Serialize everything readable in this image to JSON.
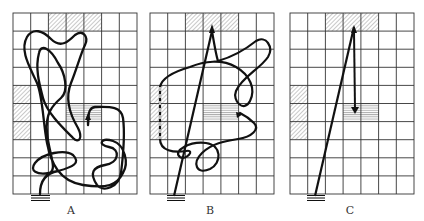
{
  "figure": {
    "panels": [
      {
        "id": "A",
        "label": "A",
        "description": "Random meandering path through grid"
      },
      {
        "id": "B",
        "label": "B",
        "description": "Straight path to top target, then meandering return to middle target"
      },
      {
        "id": "C",
        "label": "C",
        "description": "Straight path to top target, then straight down to middle target"
      }
    ],
    "grid": {
      "columns": 7,
      "rows": 10
    },
    "shaded_regions": {
      "top_diagonal": "columns 3-5, row 1",
      "left_diagonal": "column 1, rows 5-7",
      "center_horizontal": "columns 4-5, row 6"
    },
    "colors": {
      "line": "#111111",
      "grid": "#333333",
      "shade": "#999999"
    }
  }
}
